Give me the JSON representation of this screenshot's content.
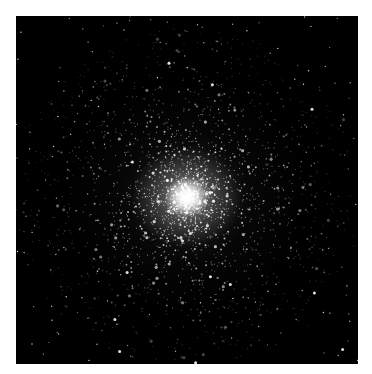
{
  "image": {
    "subject": "globular star cluster",
    "background_color": "#000000",
    "border_color": "#ffffff",
    "core_center": [
      171,
      181
    ],
    "star_color": "#ffffff"
  }
}
